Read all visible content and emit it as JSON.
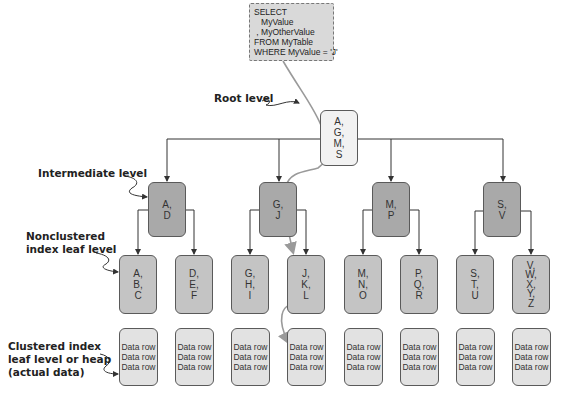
{
  "query": {
    "lines": [
      "SELECT",
      "   MyValue",
      " , MyOtherValue",
      "FROM MyTable",
      "WHERE MyValue = 'J'"
    ]
  },
  "labels": {
    "root": "Root level",
    "intermediate": "Intermediate level",
    "nonclustered_line1": "Nonclustered",
    "nonclustered_line2": "index leaf level",
    "clustered_line1": "Clustered index",
    "clustered_line2": "leaf level or heap",
    "clustered_line3": "(actual data)"
  },
  "root": {
    "keys": [
      "A,",
      "G,",
      "M,",
      "S"
    ]
  },
  "intermediate": [
    {
      "keys": [
        "A,",
        "D"
      ]
    },
    {
      "keys": [
        "G,",
        "J"
      ]
    },
    {
      "keys": [
        "M,",
        "P"
      ]
    },
    {
      "keys": [
        "S,",
        "V"
      ]
    }
  ],
  "leaves": [
    {
      "keys": [
        "A,",
        "B,",
        "C"
      ]
    },
    {
      "keys": [
        "D,",
        "E,",
        "F"
      ]
    },
    {
      "keys": [
        "G,",
        "H,",
        "I"
      ]
    },
    {
      "keys": [
        "J,",
        "K,",
        "L"
      ]
    },
    {
      "keys": [
        "M,",
        "N,",
        "O"
      ]
    },
    {
      "keys": [
        "P,",
        "Q,",
        "R"
      ]
    },
    {
      "keys": [
        "S,",
        "T,",
        "U"
      ]
    },
    {
      "keys": [
        "V,",
        "W,",
        "X,",
        "Y,",
        "Z"
      ]
    }
  ],
  "data_pages": [
    {
      "rows": [
        "Data row",
        "Data row",
        "Data row"
      ]
    },
    {
      "rows": [
        "Data row",
        "Data row",
        "Data row"
      ]
    },
    {
      "rows": [
        "Data row",
        "Data row",
        "Data row"
      ]
    },
    {
      "rows": [
        "Data row",
        "Data row",
        "Data row"
      ]
    },
    {
      "rows": [
        "Data row",
        "Data row",
        "Data row"
      ]
    },
    {
      "rows": [
        "Data row",
        "Data row",
        "Data row"
      ]
    },
    {
      "rows": [
        "Data row",
        "Data row",
        "Data row"
      ]
    },
    {
      "rows": [
        "Data row",
        "Data row",
        "Data row"
      ]
    }
  ],
  "colors": {
    "root_fill": "#f2f2f2",
    "intermediate_fill": "#a9a9a9",
    "leaf_fill": "#c4c4c4",
    "data_fill": "#e2e2e2",
    "search_path": "#9a9a9a",
    "connector": "#333333"
  }
}
